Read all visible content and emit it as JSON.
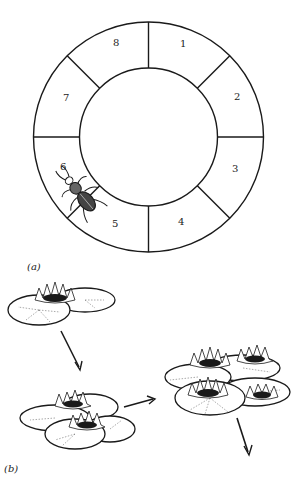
{
  "figure": {
    "panel_a": {
      "label": "(a)",
      "ring": {
        "segments": [
          {
            "label": "1"
          },
          {
            "label": "2"
          },
          {
            "label": "3"
          },
          {
            "label": "4"
          },
          {
            "label": "5"
          },
          {
            "label": "6"
          },
          {
            "label": "7"
          },
          {
            "label": "8"
          }
        ]
      },
      "beetle": {
        "icon": "beetle-icon",
        "position": "between segments 5 and 6"
      }
    },
    "panel_b": {
      "label": "(b)",
      "stages": [
        {
          "description": "single water lily on two pads",
          "flowers": 1
        },
        {
          "description": "two water lilies on overlapping pads",
          "flowers": 2
        },
        {
          "description": "four water lilies on cluster of pads",
          "flowers": 4
        }
      ],
      "arrows": [
        "down-right",
        "right",
        "down-right"
      ]
    }
  }
}
